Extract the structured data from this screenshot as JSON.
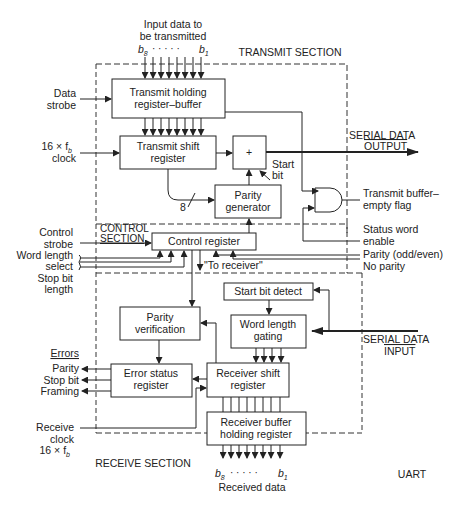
{
  "title": "UART",
  "sections": {
    "transmit": "TRANSMIT SECTION",
    "control_line1": "CONTROL",
    "control_line2": "SECTION",
    "receive": "RECEIVE SECTION"
  },
  "inputs": {
    "input_data_line1": "Input data to",
    "input_data_line2": "be transmitted",
    "input_b8": "b",
    "input_b8_sub": "8",
    "input_dots": "· · · · ·",
    "input_b1": "b",
    "input_b1_sub": "1",
    "data_strobe_line1": "Data",
    "data_strobe_line2": "strobe",
    "tx_clock_line1": "16 × f",
    "tx_clock_sub": "b",
    "tx_clock_line2": "clock",
    "control_strobe_line1": "Control",
    "control_strobe_line2": "strobe",
    "word_length_line1": "Word length",
    "word_length_line2": "select",
    "stop_bit_line1": "Stop bit",
    "stop_bit_line2": "length",
    "rx_clock_line1": "Receive",
    "rx_clock_line2": "clock",
    "rx_clock_line3": "16 × f",
    "rx_clock_sub": "b",
    "serial_in_line1": "SERIAL DATA",
    "serial_in_line2": "INPUT"
  },
  "outputs": {
    "serial_out_line1": "SERIAL DATA",
    "serial_out_line2": "OUTPUT",
    "tx_empty_line1": "Transmit buffer–",
    "tx_empty_line2": "empty flag",
    "status_enable_line1": "Status word",
    "status_enable_line2": "enable",
    "parity_odd_even": "Parity (odd/even)",
    "no_parity": "No parity",
    "errors_heading": "Errors",
    "error_parity": "Parity",
    "error_stop_bit": "Stop bit",
    "error_framing": "Framing",
    "rx_b8": "b",
    "rx_b8_sub": "8",
    "rx_dots": "· · · · ·",
    "rx_b1": "b",
    "rx_b1_sub": "1",
    "received_data": "Received data"
  },
  "blocks": {
    "tx_holding_line1": "Transmit holding",
    "tx_holding_line2": "register–buffer",
    "tx_shift_line1": "Transmit shift",
    "tx_shift_line2": "register",
    "adder_symbol": "+",
    "start_bit_line1": "Start",
    "start_bit_line2": "bit",
    "bus_width": "8",
    "parity_gen_line1": "Parity",
    "parity_gen_line2": "generator",
    "control_register": "Control register",
    "to_receiver": "\"To receiver\"",
    "start_bit_detect": "Start bit detect",
    "parity_verif_line1": "Parity",
    "parity_verif_line2": "verification",
    "word_gating_line1": "Word length",
    "word_gating_line2": "gating",
    "error_status_line1": "Error status",
    "error_status_line2": "register",
    "rx_shift_line1": "Receiver shift",
    "rx_shift_line2": "register",
    "rx_buffer_line1": "Receiver buffer",
    "rx_buffer_line2": "holding register"
  }
}
